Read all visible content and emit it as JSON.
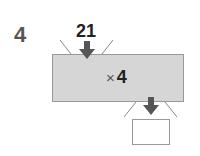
{
  "question_number": "4",
  "input_value": "21",
  "operation": {
    "symbol": "×",
    "operand": "4"
  },
  "output_value": "",
  "colors": {
    "machine_fill": "#d6d6d6",
    "arrow": "#555555",
    "text": "#222222"
  }
}
